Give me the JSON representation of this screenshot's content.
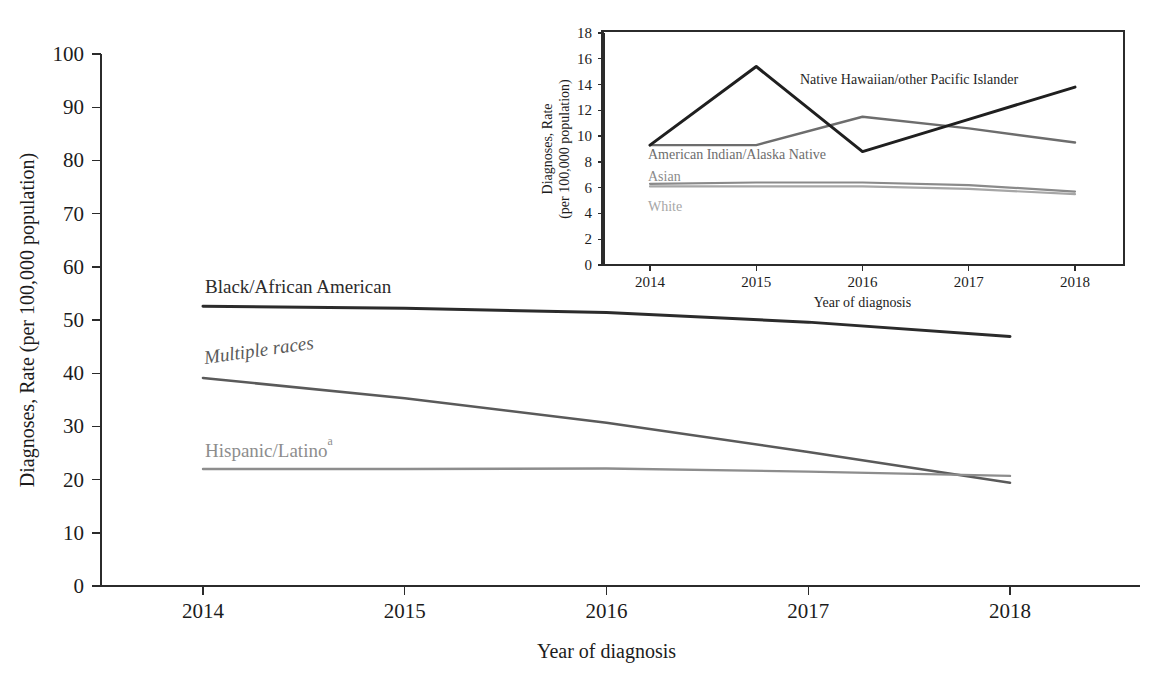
{
  "figure": {
    "background_color": "#ffffff",
    "text_color": "#1c1c1c"
  },
  "main_chart": {
    "xlabel": "Year of diagnosis",
    "ylabel": "Diagnoses, Rate (per 100,000 population)",
    "x_ticks": [
      "2014",
      "2015",
      "2016",
      "2017",
      "2018"
    ],
    "y_ticks": [
      "0",
      "10",
      "20",
      "30",
      "40",
      "50",
      "60",
      "70",
      "80",
      "90",
      "100"
    ],
    "series_labels": {
      "black": "Black/African American",
      "multiple": "Multiple races",
      "hispanic": "Hispanic/Latino",
      "hispanic_footnote": "a"
    }
  },
  "inset_chart": {
    "xlabel": "Year of diagnosis",
    "ylabel_line1": "Diagnoses, Rate",
    "ylabel_line2": "(per 100,000 population)",
    "x_ticks": [
      "2014",
      "2015",
      "2016",
      "2017",
      "2018"
    ],
    "y_ticks": [
      "0",
      "2",
      "4",
      "6",
      "8",
      "10",
      "12",
      "14",
      "16",
      "18"
    ],
    "series_labels": {
      "nhopi": "Native Hawaiian/other Pacific Islander",
      "aian": "American Indian/Alaska Native",
      "asian": "Asian",
      "white": "White"
    }
  },
  "chart_data": [
    {
      "id": "main",
      "type": "line",
      "title": "",
      "xlabel": "Year of diagnosis",
      "ylabel": "Diagnoses, Rate (per 100,000 population)",
      "x": [
        2014,
        2015,
        2016,
        2017,
        2018
      ],
      "categories": [
        "2014",
        "2015",
        "2016",
        "2017",
        "2018"
      ],
      "xlim": [
        2014,
        2018
      ],
      "ylim": [
        0,
        100
      ],
      "y_tick_step": 10,
      "grid": false,
      "legend": "inline-labels",
      "series": [
        {
          "name": "Black/African American",
          "values": [
            52.6,
            52.2,
            51.4,
            49.6,
            46.9
          ],
          "color": "#2b2b2b",
          "width": 3.0,
          "label_style": "normal"
        },
        {
          "name": "Multiple races",
          "values": [
            39.1,
            35.3,
            30.7,
            25.2,
            19.4
          ],
          "color": "#5a5a5a",
          "width": 2.6,
          "label_style": "italic"
        },
        {
          "name": "Hispanic/Latino",
          "values": [
            22.0,
            22.0,
            22.1,
            21.5,
            20.7
          ],
          "color": "#8d8d8d",
          "width": 2.4,
          "label_style": "normal",
          "footnote": "a"
        }
      ]
    },
    {
      "id": "inset",
      "type": "line",
      "title": "",
      "xlabel": "Year of diagnosis",
      "ylabel": "Diagnoses, Rate (per 100,000 population)",
      "x": [
        2014,
        2015,
        2016,
        2017,
        2018
      ],
      "categories": [
        "2014",
        "2015",
        "2016",
        "2017",
        "2018"
      ],
      "xlim": [
        2014,
        2018
      ],
      "ylim": [
        0,
        18
      ],
      "y_tick_step": 2,
      "grid": false,
      "legend": "inline-labels",
      "series": [
        {
          "name": "Native Hawaiian/other Pacific Islander",
          "values": [
            9.3,
            15.4,
            8.8,
            11.3,
            13.8
          ],
          "color": "#1f1f1f",
          "width": 3.0,
          "label_style": "normal"
        },
        {
          "name": "American Indian/Alaska Native",
          "values": [
            9.3,
            9.3,
            11.5,
            10.6,
            9.5
          ],
          "color": "#6d6d6d",
          "width": 2.4,
          "label_style": "normal"
        },
        {
          "name": "Asian",
          "values": [
            6.3,
            6.4,
            6.4,
            6.2,
            5.7
          ],
          "color": "#8a8a8a",
          "width": 2.2,
          "label_style": "normal"
        },
        {
          "name": "White",
          "values": [
            6.1,
            6.1,
            6.1,
            5.9,
            5.5
          ],
          "color": "#a6a6a6",
          "width": 2.2,
          "label_style": "normal"
        }
      ]
    }
  ]
}
